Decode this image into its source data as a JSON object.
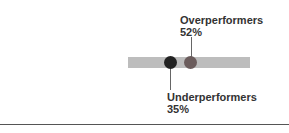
{
  "chart_data": {
    "type": "scatter",
    "title": "",
    "series": [
      {
        "name": "Underperformers",
        "value": 35,
        "label": "35%",
        "color": "#222222"
      },
      {
        "name": "Overperformers",
        "value": 52,
        "label": "52%",
        "color": "#6b5c5c"
      }
    ],
    "xlim": [
      0,
      100
    ],
    "track_color": "#bdbdbd"
  },
  "labels": {
    "over_name": "Overperformers",
    "over_value": "52%",
    "under_name": "Underperformers",
    "under_value": "35%"
  }
}
